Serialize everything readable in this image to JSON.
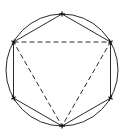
{
  "diagram": {
    "canvas": {
      "width": 127,
      "height": 136
    },
    "circle": {
      "cx": 62,
      "cy": 70,
      "r": 56
    },
    "hexagon": {
      "style": "solid",
      "vertices": [
        [
          62,
          14
        ],
        [
          110.5,
          42
        ],
        [
          110.5,
          98
        ],
        [
          62,
          126
        ],
        [
          13.5,
          98
        ],
        [
          13.5,
          42
        ]
      ]
    },
    "triangle": {
      "style": "dashed",
      "vertices": [
        [
          13.5,
          42
        ],
        [
          110.5,
          42
        ],
        [
          62,
          126
        ]
      ]
    },
    "colors": {
      "stroke": "#2a2a2a",
      "background": "#ffffff"
    }
  }
}
